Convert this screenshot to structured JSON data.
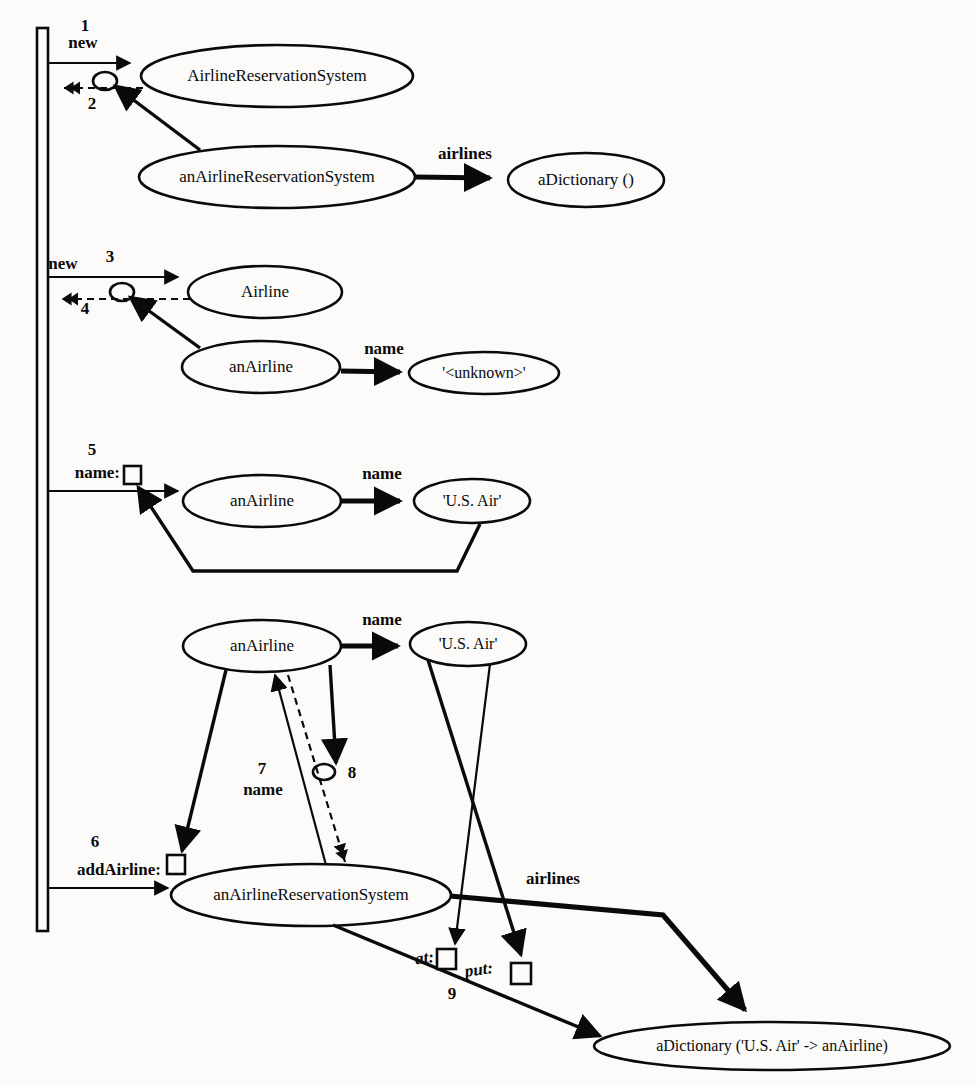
{
  "diagram": {
    "background_color": "#fcfbf9",
    "ink_color": "#0a0a0a",
    "lifeline": {
      "name": "actor-lifeline"
    },
    "nodes": [
      {
        "id": "n1",
        "label": "AirlineReservationSystem",
        "cx": 277,
        "cy": 76,
        "rx": 136,
        "ry": 31
      },
      {
        "id": "n2",
        "label": "anAirlineReservationSystem",
        "cx": 277,
        "cy": 177,
        "rx": 138,
        "ry": 31
      },
      {
        "id": "n3",
        "label": "aDictionary ()",
        "cx": 586,
        "cy": 180,
        "rx": 78,
        "ry": 27
      },
      {
        "id": "n4",
        "label": "Airline",
        "cx": 265,
        "cy": 292,
        "rx": 77,
        "ry": 26
      },
      {
        "id": "n5",
        "label": "anAirline",
        "cx": 261,
        "cy": 367,
        "rx": 79,
        "ry": 26
      },
      {
        "id": "n6",
        "label": "'<unknown>'",
        "cx": 484,
        "cy": 373,
        "rx": 75,
        "ry": 21
      },
      {
        "id": "n7",
        "label": "anAirline",
        "cx": 262,
        "cy": 501,
        "rx": 79,
        "ry": 26
      },
      {
        "id": "n8",
        "label": "'U.S. Air'",
        "cx": 472,
        "cy": 501,
        "rx": 58,
        "ry": 22
      },
      {
        "id": "n9",
        "label": "anAirline",
        "cx": 262,
        "cy": 646,
        "rx": 79,
        "ry": 26
      },
      {
        "id": "n10",
        "label": "'U.S. Air'",
        "cx": 468,
        "cy": 644,
        "rx": 58,
        "ry": 22
      },
      {
        "id": "n11",
        "label": "anAirlineReservationSystem",
        "cx": 311,
        "cy": 895,
        "rx": 140,
        "ry": 31
      },
      {
        "id": "n12",
        "label": "aDictionary ('U.S. Air' -> anAirline)",
        "cx": 772,
        "cy": 1046,
        "rx": 178,
        "ry": 24
      }
    ],
    "messages": [
      {
        "seq": "1",
        "label": "new",
        "name": "message-new-ars"
      },
      {
        "seq": "2",
        "label": "",
        "name": "return-ars"
      },
      {
        "seq": "3",
        "label": "new",
        "name": "message-new-airline"
      },
      {
        "seq": "4",
        "label": "",
        "name": "return-airline"
      },
      {
        "seq": "5",
        "label": "name:",
        "name": "message-name-set"
      },
      {
        "seq": "6",
        "label": "addAirline:",
        "name": "message-add-airline"
      },
      {
        "seq": "7",
        "label": "name",
        "name": "message-name-get"
      },
      {
        "seq": "8",
        "label": "",
        "name": "return-name"
      },
      {
        "seq": "9",
        "label": "",
        "name": "message-at-put"
      }
    ],
    "attribute_links": [
      {
        "label": "airlines",
        "name": "link-airlines-top",
        "x": 465,
        "y": 155
      },
      {
        "label": "name",
        "name": "link-name-unknown",
        "x": 384,
        "y": 350
      },
      {
        "label": "name",
        "name": "link-name-usair-mid",
        "x": 382,
        "y": 475
      },
      {
        "label": "name",
        "name": "link-name-usair-bot",
        "x": 382,
        "y": 621
      },
      {
        "label": "airlines",
        "name": "link-airlines-bottom",
        "x": 553,
        "y": 880
      }
    ],
    "keyword_labels": [
      {
        "label": "at:",
        "name": "keyword-at",
        "x": 434,
        "y": 958
      },
      {
        "label": "put:",
        "name": "keyword-put",
        "x": 487,
        "y": 973
      }
    ],
    "sequence_numbers": [
      {
        "value": "1",
        "x": 85,
        "y": 27
      },
      {
        "value": "2",
        "x": 92,
        "y": 105
      },
      {
        "value": "3",
        "x": 110,
        "y": 258
      },
      {
        "value": "4",
        "x": 85,
        "y": 310
      },
      {
        "value": "5",
        "x": 92,
        "y": 451
      },
      {
        "value": "6",
        "x": 95,
        "y": 843
      },
      {
        "value": "7",
        "x": 262,
        "y": 770
      },
      {
        "value": "8",
        "x": 352,
        "y": 774
      },
      {
        "value": "9",
        "x": 452,
        "y": 995
      }
    ],
    "message_labels": [
      {
        "label": "new",
        "x": 83,
        "y": 44,
        "anchor": "start"
      },
      {
        "label": "new",
        "x": 63,
        "y": 265,
        "anchor": "start"
      },
      {
        "label": "name:",
        "x": 120,
        "y": 474,
        "anchor": "end"
      },
      {
        "label": "addAirline:",
        "x": 161,
        "y": 871,
        "anchor": "end"
      },
      {
        "label": "name",
        "x": 263,
        "y": 791,
        "anchor": "middle"
      }
    ]
  }
}
